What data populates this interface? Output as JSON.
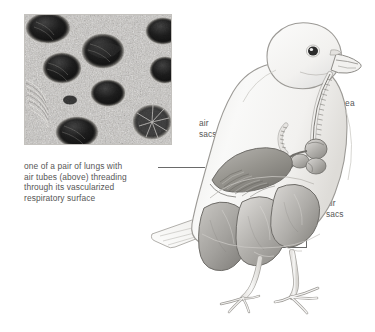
{
  "figure": {
    "background_color": "#ffffff",
    "text_color": "#565656",
    "line_color": "#6a6a6a"
  },
  "micrograph": {
    "name": "scanning electron micrograph of avian lung air tubes",
    "alt": "Electron micrograph showing circular openings of parabronchi air tubes in vascularized lung tissue",
    "colors": {
      "tissue_light": "#d8d6d2",
      "tissue_mid": "#8f8d89",
      "pore_dark": "#1d1d1d",
      "border": "#b8b6b2"
    }
  },
  "labels": {
    "lung_caption": "one of a pair of lungs with\nair tubes (above) threading\nthrough its vascularized\nrespiratory surface",
    "trachea": "trachea",
    "air_sacs_upper": "air\nsacs",
    "air_sacs_right": "air\nsacs"
  },
  "bird": {
    "species_depiction": "pigeon",
    "body_fill": "#f4f3f1",
    "body_outline": "#9c9a96",
    "organ_fill_light": "#d2d0cd",
    "organ_fill_mid": "#a9a7a3",
    "organ_fill_dark": "#8a8884",
    "organ_outline": "#6f6d69",
    "eye_color": "#2b2b2b",
    "parts": [
      "head",
      "beak",
      "eye",
      "neck",
      "trachea",
      "body",
      "wing",
      "tail",
      "legs",
      "feet",
      "lung",
      "air-sacs"
    ]
  }
}
